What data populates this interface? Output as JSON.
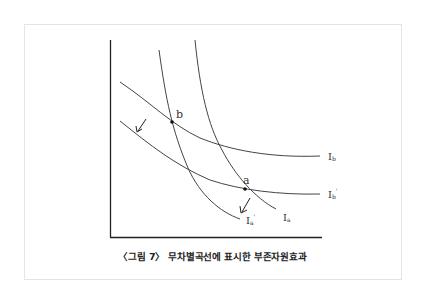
{
  "figure": {
    "caption": "〈그림 7〉 무차별곡선에 표시한 부존자원효과"
  },
  "diagram": {
    "type": "indifference-curve-diagram",
    "axes": {
      "x_label": "",
      "y_label": ""
    },
    "curves": [
      {
        "id": "Ib",
        "label": "Ib",
        "label_main": "I",
        "label_sub": "b",
        "prime": false
      },
      {
        "id": "Ib_prime",
        "label": "Ib'",
        "label_main": "I",
        "label_sub": "b",
        "prime": true
      },
      {
        "id": "Ia",
        "label": "Ia",
        "label_main": "I",
        "label_sub": "a",
        "prime": false
      },
      {
        "id": "Ia_prime",
        "label": "Ia'",
        "label_main": "I",
        "label_sub": "a",
        "prime": true
      }
    ],
    "points": [
      {
        "id": "a",
        "label": "a"
      },
      {
        "id": "b",
        "label": "b"
      }
    ],
    "arrows": [
      {
        "from": "Ib",
        "to": "Ib_prime",
        "meaning": "shift down-left"
      },
      {
        "from": "Ia",
        "to": "Ia_prime",
        "meaning": "shift down-left"
      }
    ],
    "colors": {
      "line": "#333333",
      "frame": "#e4e4e4"
    }
  }
}
